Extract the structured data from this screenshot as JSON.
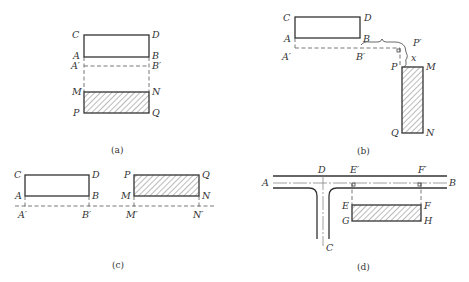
{
  "figure": {
    "panels": [
      {
        "id": "a",
        "caption": "(a)",
        "labels": {
          "C": "C",
          "D": "D",
          "A": "A",
          "B": "B",
          "A_prime": "A′",
          "B_prime": "B′",
          "M": "M",
          "N": "N",
          "P": "P",
          "Q": "Q"
        }
      },
      {
        "id": "b",
        "caption": "(b)",
        "labels": {
          "C": "C",
          "D": "D",
          "A": "A",
          "B": "B",
          "A_prime": "A′",
          "B_prime": "B′",
          "P_prime": "P′",
          "x": "x",
          "P": "P",
          "M": "M",
          "Q": "Q",
          "N": "N"
        }
      },
      {
        "id": "c",
        "caption": "(c)",
        "labels": {
          "C": "C",
          "D": "D",
          "A": "A",
          "B": "B",
          "A_prime": "A′",
          "B_prime": "B′",
          "P": "P",
          "Q": "Q",
          "M": "M",
          "N": "N",
          "M_prime": "M′",
          "N_prime": "N′"
        }
      },
      {
        "id": "d",
        "caption": "(d)",
        "labels": {
          "A": "A",
          "D": "D",
          "E_prime": "E′",
          "F_prime": "F′",
          "B": "B",
          "E": "E",
          "F": "F",
          "G": "G",
          "H": "H",
          "C": "C"
        }
      }
    ]
  }
}
